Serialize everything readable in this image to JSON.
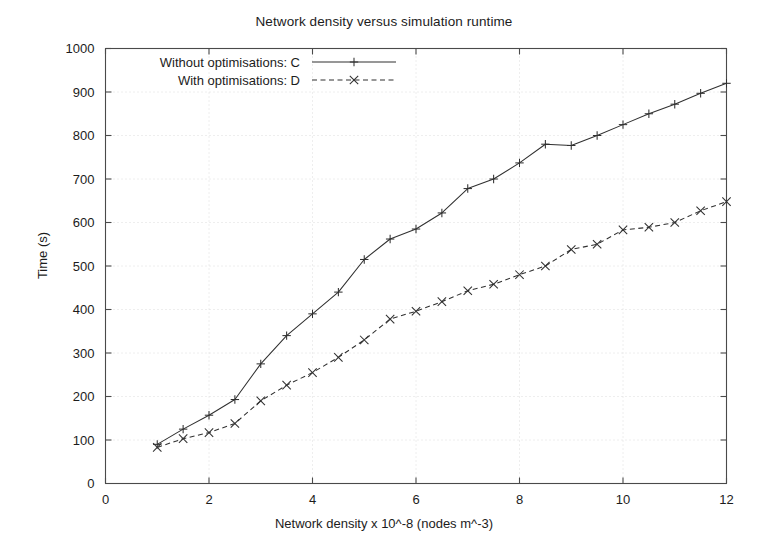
{
  "chart_data": {
    "type": "line",
    "title": "Network density versus simulation runtime",
    "xlabel": "Network density x 10^-8 (nodes m^-3)",
    "ylabel": "Time (s)",
    "xlim": [
      0,
      12
    ],
    "ylim": [
      0,
      1000
    ],
    "xticks": [
      "0",
      "2",
      "4",
      "6",
      "8",
      "10",
      "12"
    ],
    "xtick_values": [
      0,
      2,
      4,
      6,
      8,
      10,
      12
    ],
    "yticks": [
      "0",
      "100",
      "200",
      "300",
      "400",
      "500",
      "600",
      "700",
      "800",
      "900",
      "1000"
    ],
    "ytick_values": [
      0,
      100,
      200,
      300,
      400,
      500,
      600,
      700,
      800,
      900,
      1000
    ],
    "grid": true,
    "legend_position": "top-left",
    "x": [
      1,
      1.5,
      2,
      2.5,
      3,
      3.5,
      4,
      4.5,
      5,
      5.5,
      6,
      6.5,
      7,
      7.5,
      8,
      8.5,
      9,
      9.5,
      10,
      10.5,
      11,
      11.5,
      12
    ],
    "series": [
      {
        "name": "Without optimisations: C",
        "marker": "plus",
        "dash": "solid",
        "color": "#303030",
        "values": [
          90,
          125,
          157,
          193,
          275,
          340,
          390,
          440,
          515,
          562,
          585,
          622,
          678,
          700,
          737,
          780,
          777,
          800,
          825,
          850,
          872,
          897,
          920
        ]
      },
      {
        "name": "With optimisations: D",
        "marker": "cross",
        "dash": "dashed",
        "color": "#303030",
        "values": [
          83,
          103,
          117,
          138,
          190,
          226,
          255,
          290,
          330,
          378,
          396,
          418,
          443,
          458,
          480,
          500,
          538,
          550,
          583,
          589,
          600,
          627,
          648
        ]
      }
    ]
  },
  "legend": {
    "items": [
      {
        "label": "Without optimisations: C"
      },
      {
        "label": "With optimisations: D"
      }
    ]
  }
}
